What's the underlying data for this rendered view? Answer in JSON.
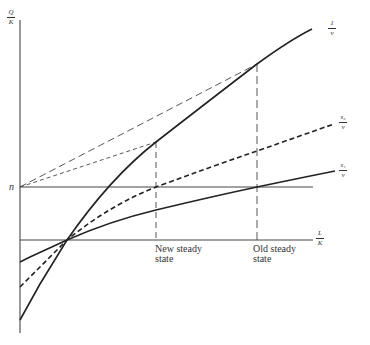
{
  "diagram": {
    "type": "economic-growth-diagram",
    "y_axis_label": {
      "numerator": "Q",
      "denominator": "K"
    },
    "x_axis_label": {
      "numerator": "L",
      "denominator": "K"
    },
    "n_label": "n",
    "curves": [
      {
        "id": "one-over-v",
        "label_num": "1",
        "label_den": "v",
        "style": "solid"
      },
      {
        "id": "s2-over-v",
        "label_num": "s₂",
        "label_den": "v",
        "style": "dashed"
      },
      {
        "id": "s1-over-v",
        "label_num": "s₁",
        "label_den": "v",
        "style": "solid"
      }
    ],
    "markers": [
      {
        "id": "new-steady-state",
        "line1": "New steady",
        "line2": "state"
      },
      {
        "id": "old-steady-state",
        "line1": "Old steady",
        "line2": "state"
      }
    ],
    "colors": {
      "line": "#2a2a2a",
      "background": "#ffffff"
    }
  }
}
